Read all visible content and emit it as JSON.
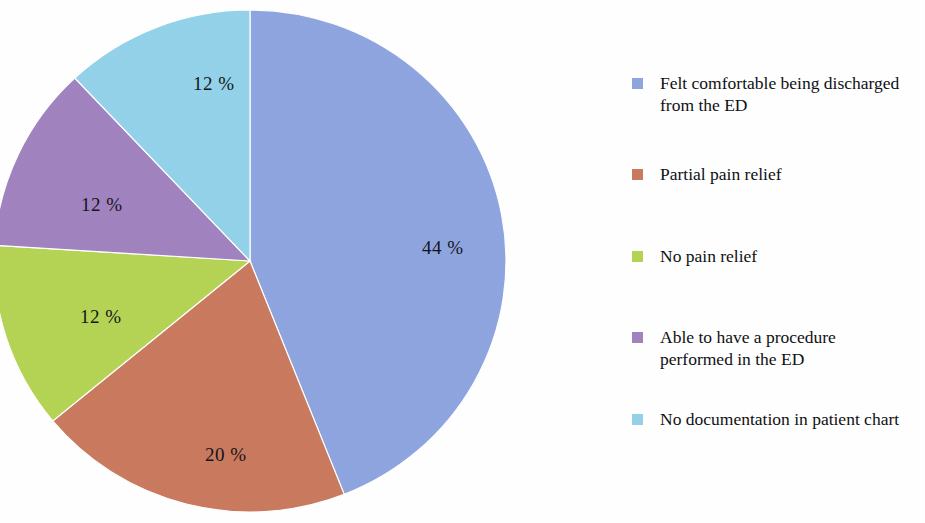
{
  "chart_data": {
    "type": "pie",
    "title": "",
    "subtitle": "",
    "xlabel": "",
    "ylabel": "",
    "grid": false,
    "legend_position": "right",
    "start_angle_deg": 0,
    "direction": "clockwise",
    "categories": [
      "Felt comfortable being discharged from the ED",
      "Partial pain relief",
      "No pain relief",
      "Able to have a procedure performed in the ED",
      "No documentation in patient chart"
    ],
    "values": [
      44,
      20,
      12,
      12,
      12
    ],
    "value_unit": "%",
    "data_labels": [
      "44 %",
      "20 %",
      "12 %",
      "12 %",
      "12 %"
    ],
    "colors": [
      "#8fa5e0",
      "#c97a5f",
      "#b5d455",
      "#a183c0",
      "#93d2e8"
    ],
    "slices": [
      {
        "label": "Felt comfortable being discharged from the ED",
        "value": 44,
        "data_label": "44 %",
        "color": "#8fa5e0",
        "label_x": 422,
        "label_y": 238
      },
      {
        "label": "Partial pain relief",
        "value": 20,
        "data_label": "20 %",
        "color": "#c97a5f",
        "label_x": 205,
        "label_y": 445
      },
      {
        "label": "No pain relief",
        "value": 12,
        "data_label": "12 %",
        "color": "#b5d455",
        "label_x": 80,
        "label_y": 307
      },
      {
        "label": "Able to have a procedure performed in the ED",
        "value": 12,
        "data_label": "12 %",
        "color": "#a183c0",
        "label_x": 81,
        "label_y": 195
      },
      {
        "label": "No documentation in patient chart",
        "value": 12,
        "data_label": "12 %",
        "color": "#93d2e8",
        "label_x": 193,
        "label_y": 74
      }
    ]
  },
  "legend": {
    "items": [
      {
        "label": "Felt comfortable being discharged from the ED",
        "color": "#8fa5e0",
        "swatch_name": "legend-swatch-blue",
        "top": 12
      },
      {
        "label": "Partial pain relief",
        "color": "#c97a5f",
        "swatch_name": "legend-swatch-orange",
        "top": 103
      },
      {
        "label": "No pain relief",
        "color": "#b5d455",
        "swatch_name": "legend-swatch-green",
        "top": 185
      },
      {
        "label": "Able to have a procedure performed in the ED",
        "color": "#a183c0",
        "swatch_name": "legend-swatch-purple",
        "top": 266
      },
      {
        "label": "No documentation in patient chart",
        "color": "#93d2e8",
        "swatch_name": "legend-swatch-cyan",
        "top": 348
      }
    ]
  },
  "geometry": {
    "center_x": 250,
    "center_y": 261,
    "radius_x": 256,
    "radius_y": 251
  }
}
